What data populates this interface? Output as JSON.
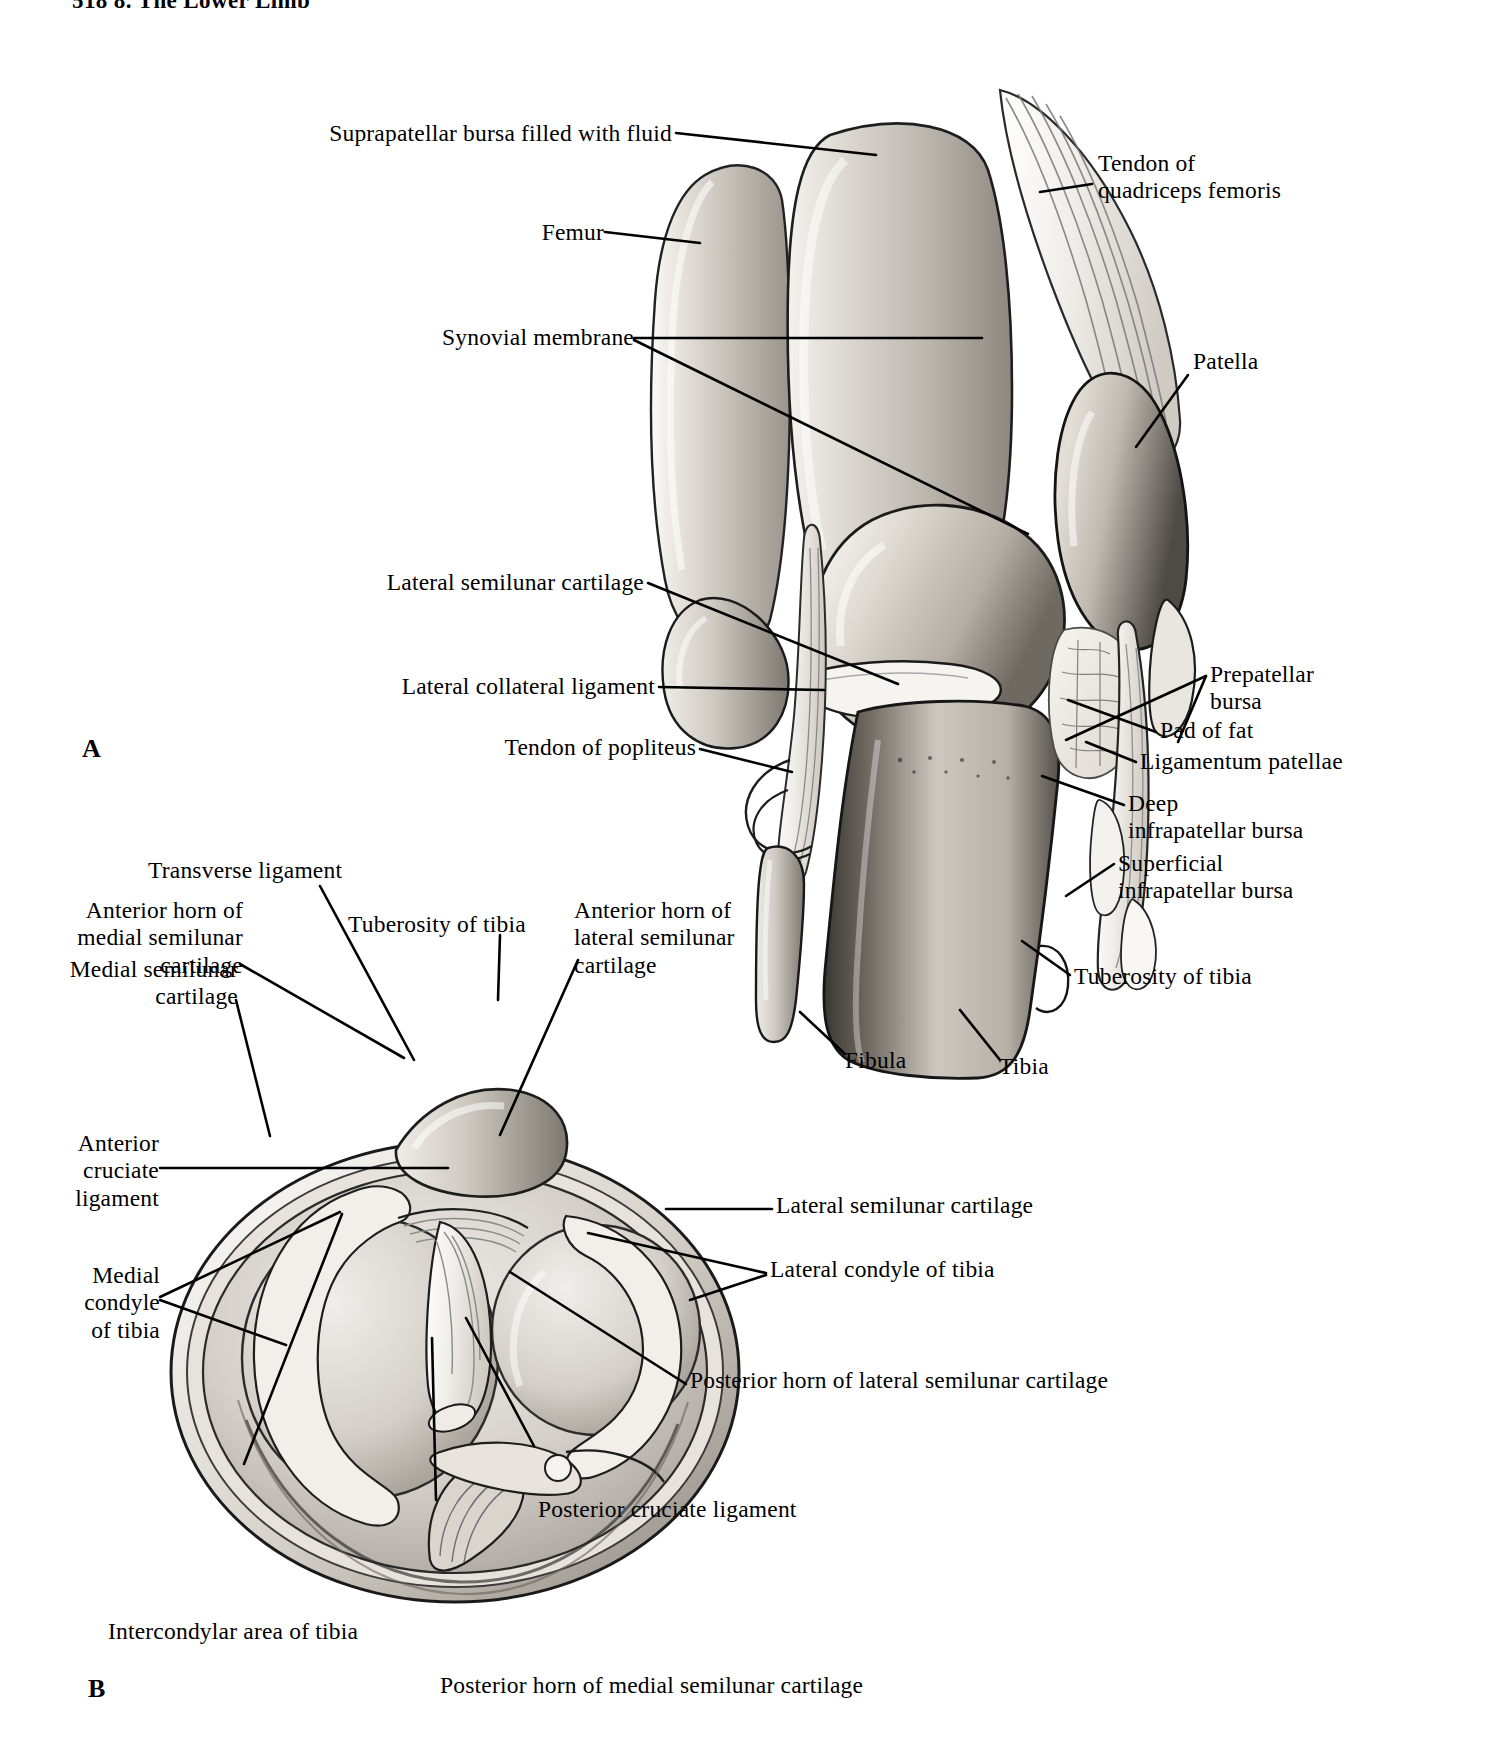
{
  "page": {
    "running_head": "518   8. The Lower Limb",
    "background_color": "#ffffff",
    "ink_color": "#000000"
  },
  "figures": [
    {
      "letter": "A",
      "caption_letter": "A"
    },
    {
      "letter": "B",
      "caption_letter": "B"
    }
  ],
  "figure_a": {
    "letter": "A",
    "labels": [
      {
        "id": "suprapatellar-bursa",
        "text": "Suprapatellar bursa filled with fluid",
        "align": "right"
      },
      {
        "id": "femur",
        "text": "Femur",
        "align": "right"
      },
      {
        "id": "synovial-membrane",
        "text": "Synovial membrane",
        "align": "right"
      },
      {
        "id": "lateral-semilunar-cartilage",
        "text": "Lateral semilunar cartilage",
        "align": "right"
      },
      {
        "id": "lateral-collateral-ligament",
        "text": "Lateral collateral ligament",
        "align": "right"
      },
      {
        "id": "tendon-of-popliteus",
        "text": "Tendon of popliteus",
        "align": "right"
      },
      {
        "id": "tendon-of-quadriceps-femoris",
        "text": "Tendon of\nquadriceps femoris",
        "align": "left"
      },
      {
        "id": "patella",
        "text": "Patella",
        "align": "left"
      },
      {
        "id": "prepatellar-bursa",
        "text": "Prepatellar\nbursa",
        "align": "left"
      },
      {
        "id": "pad-of-fat",
        "text": "Pad of fat",
        "align": "left"
      },
      {
        "id": "ligamentum-patellae",
        "text": "Ligamentum patellae",
        "align": "left"
      },
      {
        "id": "deep-infrapatellar-bursa",
        "text": "Deep\ninfrapatellar bursa",
        "align": "left"
      },
      {
        "id": "superficial-infrapatellar-bursa",
        "text": "Superficial\ninfrapatellar bursa",
        "align": "left"
      },
      {
        "id": "tuberosity-of-tibia",
        "text": "Tuberosity of tibia",
        "align": "left"
      },
      {
        "id": "fibula",
        "text": "Fibula",
        "align": "left"
      },
      {
        "id": "tibia",
        "text": "Tibia",
        "align": "left"
      }
    ]
  },
  "figure_b": {
    "letter": "B",
    "labels": [
      {
        "id": "transverse-ligament",
        "text": "Transverse ligament",
        "align": "left"
      },
      {
        "id": "anterior-horn-medial-semilunar-cartilage",
        "text": "Anterior horn of\nmedial semilunar\ncartilage",
        "align": "right"
      },
      {
        "id": "tuberosity-of-tibia-b",
        "text": "Tuberosity of tibia",
        "align": "left"
      },
      {
        "id": "anterior-horn-lateral-semilunar-cartilage",
        "text": "Anterior horn of\nlateral semilunar\ncartilage",
        "align": "left"
      },
      {
        "id": "medial-semilunar-cartilage",
        "text": "Medial semilunar\ncartilage",
        "align": "right"
      },
      {
        "id": "anterior-cruciate-ligament",
        "text": "Anterior\ncruciate\nligament",
        "align": "right"
      },
      {
        "id": "medial-condyle-of-tibia",
        "text": "Medial\ncondyle\nof tibia",
        "align": "right"
      },
      {
        "id": "lateral-semilunar-cartilage-b",
        "text": "Lateral semilunar cartilage",
        "align": "left"
      },
      {
        "id": "lateral-condyle-of-tibia",
        "text": "Lateral condyle of tibia",
        "align": "left"
      },
      {
        "id": "posterior-horn-lateral-semilunar-cartilage",
        "text": "Posterior horn of lateral semilunar cartilage",
        "align": "left"
      },
      {
        "id": "posterior-cruciate-ligament",
        "text": "Posterior cruciate ligament",
        "align": "left"
      },
      {
        "id": "intercondylar-area-of-tibia",
        "text": "Intercondylar area of tibia",
        "align": "left"
      },
      {
        "id": "posterior-horn-medial-semilunar-cartilage",
        "text": "Posterior horn of medial semilunar cartilage",
        "align": "left"
      }
    ]
  }
}
